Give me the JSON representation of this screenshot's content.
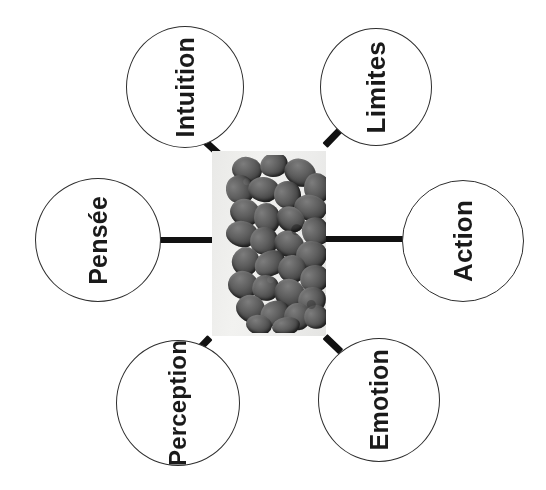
{
  "diagram": {
    "background_color": "#ffffff",
    "center": {
      "name": "central-photo",
      "description": "grayscale photograph of a dense cluster of dark rounded grains on a light gray panel",
      "panel_color": "#ececeb",
      "grain_color": "#4a4a4a"
    },
    "nodes": [
      {
        "id": "intuition",
        "label": "Intuition",
        "position": "top-left"
      },
      {
        "id": "limites",
        "label": "Limites",
        "position": "top-right"
      },
      {
        "id": "pensee",
        "label": "Pensée",
        "position": "left"
      },
      {
        "id": "action",
        "label": "Action",
        "position": "right"
      },
      {
        "id": "perception",
        "label": "Perception",
        "position": "bottom-left"
      },
      {
        "id": "emotion",
        "label": "Emotion",
        "position": "bottom-right"
      }
    ],
    "connectors": [
      {
        "id": "intuition-center",
        "from": "intuition",
        "to": "center",
        "style": "diagonal-stub"
      },
      {
        "id": "limites-center",
        "from": "limites",
        "to": "center",
        "style": "diagonal-stub"
      },
      {
        "id": "pensee-center",
        "from": "pensee",
        "to": "center",
        "style": "horizontal-bar"
      },
      {
        "id": "center-action",
        "from": "center",
        "to": "action",
        "style": "horizontal-bar"
      },
      {
        "id": "perception-center",
        "from": "perception",
        "to": "center",
        "style": "diagonal-stub"
      },
      {
        "id": "emotion-center",
        "from": "emotion",
        "to": "center",
        "style": "diagonal-stub"
      }
    ],
    "colors": {
      "node_stroke": "#2e2e2e",
      "node_fill": "#ffffff",
      "label_text": "#1a1a1a",
      "connector": "#111111"
    },
    "text_orientation": "vertical (rotated 90 degrees clockwise)"
  }
}
